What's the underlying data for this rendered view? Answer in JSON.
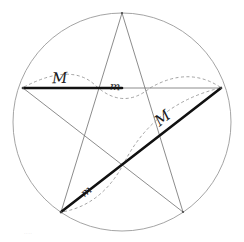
{
  "figure": {
    "background_color": "#ffffff",
    "width": 244,
    "height": 242
  },
  "style": {
    "circle_color": "#9a9a9a",
    "thin_line_color": "#6e6e6e",
    "bold_line_color": "#111111",
    "dash_color": "#8c8c8c",
    "label_color": "#1a1a1a",
    "thin_width": 0.8,
    "bold_width": 2.6,
    "circle_width": 0.9,
    "dash_width": 0.8,
    "dash_pattern": "3,2.5"
  },
  "circle": {
    "name": "circumscribed-circle",
    "cx": 122,
    "cy": 122,
    "r": 109
  },
  "vertices": [
    {
      "name": "top",
      "x": 122,
      "y": 13
    },
    {
      "name": "right",
      "x": 221,
      "y": 88
    },
    {
      "name": "bottom-right",
      "x": 183,
      "y": 212
    },
    {
      "name": "bottom-left",
      "x": 61,
      "y": 212
    },
    {
      "name": "left",
      "x": 23,
      "y": 88
    }
  ],
  "chords": [
    {
      "name": "chord-top-to-bottom-right",
      "from": "top",
      "to": "bottom-right",
      "weight": "thin"
    },
    {
      "name": "chord-bottom-right-to-left",
      "from": "bottom-right",
      "to": "left",
      "weight": "thin"
    },
    {
      "name": "chord-left-to-right",
      "from": "left",
      "to": "right",
      "weight": "split"
    },
    {
      "name": "chord-right-to-bottom-left",
      "from": "right",
      "to": "bottom-left",
      "weight": "bold"
    },
    {
      "name": "chord-bottom-left-to-top",
      "from": "bottom-left",
      "to": "top",
      "weight": "thin"
    }
  ],
  "bold_segments": [
    {
      "name": "bold-horizontal-segment",
      "x1": 23,
      "y1": 88,
      "x2": 122,
      "y2": 88,
      "label": "M",
      "description": "major part of the horizontal chord"
    },
    {
      "name": "bold-diagonal-segment",
      "x1": 221,
      "y1": 88,
      "x2": 61,
      "y2": 212,
      "label": "M",
      "description": "full diagonal chord drawn bold"
    }
  ],
  "labels": [
    {
      "id": "label-M-horizontal",
      "name": "label-major-horizontal",
      "text": "M",
      "case": "uppercase",
      "segment": "bold-horizontal-segment"
    },
    {
      "id": "label-m-horizontal",
      "name": "label-minor-horizontal",
      "text": "m",
      "case": "lowercase",
      "segment": "thin-horizontal-remainder"
    },
    {
      "id": "label-M-diagonal",
      "name": "label-major-diagonal",
      "text": "M",
      "case": "uppercase",
      "segment": "upper-diagonal"
    },
    {
      "id": "label-m-diagonal",
      "name": "label-minor-diagonal",
      "text": "m",
      "case": "lowercase",
      "segment": "lower-diagonal"
    }
  ],
  "dashed_arcs": [
    {
      "name": "dashed-arc-over-M-horizontal",
      "spans": "left vertex to first interior intersection",
      "bulge": "up"
    },
    {
      "name": "dashed-arc-under-m-horizontal",
      "spans": "first interior intersection to second interior intersection",
      "bulge": "down"
    },
    {
      "name": "dashed-arc-over-right-horizontal",
      "spans": "second interior intersection to right vertex",
      "bulge": "up"
    },
    {
      "name": "dashed-arc-over-M-diagonal",
      "spans": "right vertex to diagonal crossing point",
      "bulge": "left"
    },
    {
      "name": "dashed-arc-under-m-diagonal",
      "spans": "diagonal crossing point to bottom-left vertex",
      "bulge": "right"
    }
  ],
  "corner": {
    "mark": "····"
  }
}
